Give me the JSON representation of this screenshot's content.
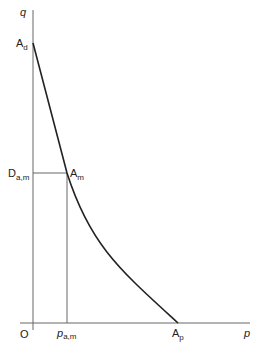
{
  "diagram": {
    "axes": {
      "y_label": "q",
      "x_label": "p",
      "origin_label": "O"
    },
    "points": {
      "a_d": {
        "main": "A",
        "sub": "d"
      },
      "a_m": {
        "main": "A",
        "sub": "m"
      },
      "a_p": {
        "main": "A",
        "sub": "p"
      },
      "d_am": {
        "main": "D",
        "sub": "a,m"
      },
      "p_am": {
        "main": "p",
        "sub": "a,m"
      }
    },
    "colors": {
      "axis": "#555555",
      "curve": "#222222",
      "text": "#222222"
    }
  }
}
